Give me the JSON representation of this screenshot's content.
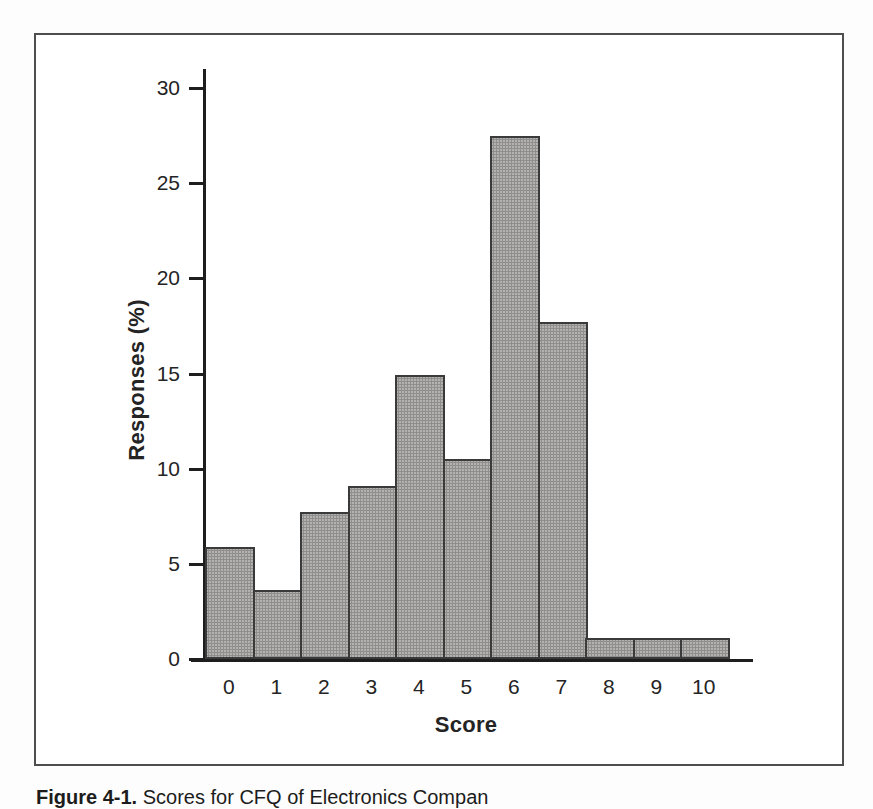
{
  "figure": {
    "kind": "scanned-book-bar-chart",
    "frame_border_color": "#4e4e4e",
    "background_color": "#ffffff"
  },
  "chart_data": {
    "type": "bar",
    "title": "",
    "categories": [
      "0",
      "1",
      "2",
      "3",
      "4",
      "5",
      "6",
      "7",
      "8",
      "9",
      "10"
    ],
    "values": [
      5.9,
      3.6,
      7.7,
      9.1,
      14.9,
      10.5,
      27.5,
      17.7,
      1.1,
      1.1,
      1.1
    ],
    "xlabel": "Score",
    "ylabel": "Responses (%)",
    "ylim": [
      0,
      31
    ],
    "yticks": [
      0,
      5,
      10,
      15,
      20,
      25,
      30
    ],
    "grid": false,
    "legend": false,
    "bar_fill": "#b3b2b0",
    "bar_border": "#3a3a3a",
    "axis_color": "#1e1e1e"
  },
  "caption": {
    "label": "Figure 4-1.",
    "text": "Scores for CFQ of Electronics Compan"
  }
}
